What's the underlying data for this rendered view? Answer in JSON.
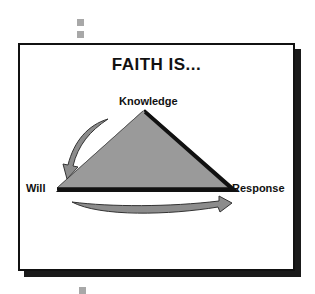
{
  "title": "FAITH IS...",
  "vertices": {
    "top": "Knowledge",
    "left": "Will",
    "right": "Response"
  },
  "colors": {
    "triangle_fill": "#9a9a9a",
    "arrow_fill": "#8c8c8c",
    "outline": "#111111",
    "shadow": "#1a1a1a",
    "bullet_squares": "#a8a8a8"
  },
  "arrows": [
    {
      "from": "Knowledge",
      "to": "Will"
    },
    {
      "from": "Will",
      "to": "Response"
    }
  ]
}
